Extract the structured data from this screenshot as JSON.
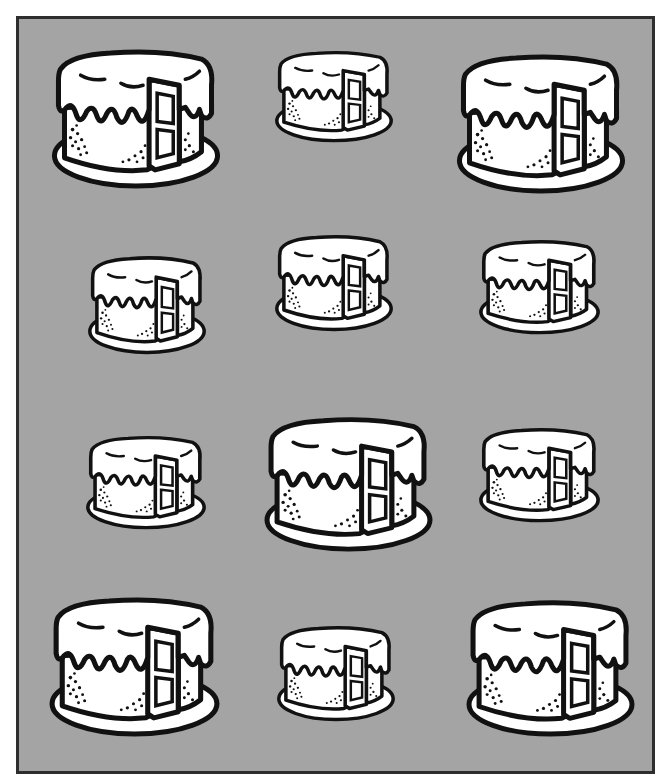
{
  "image": {
    "description": "Grid of twelve black-and-white line-art frosted layer cakes with a slice removed, on a gray background inside a dark border",
    "subject": "cake",
    "count": 12,
    "layout": {
      "rows": 4,
      "cols": 3
    }
  },
  "colors": {
    "background_gray": "#a4a4a4",
    "border": "#2e2e2e",
    "outline": "#111111",
    "fill": "#ffffff",
    "page": "#ffffff"
  },
  "cakes": [
    {
      "row": 1,
      "col": 1,
      "size": "large",
      "x": 50,
      "y": 45,
      "w": 172,
      "h": 146
    },
    {
      "row": 1,
      "col": 2,
      "size": "small",
      "x": 274,
      "y": 48,
      "w": 120,
      "h": 96
    },
    {
      "row": 1,
      "col": 3,
      "size": "large",
      "x": 455,
      "y": 50,
      "w": 172,
      "h": 146
    },
    {
      "row": 2,
      "col": 1,
      "size": "small",
      "x": 87,
      "y": 253,
      "w": 120,
      "h": 103
    },
    {
      "row": 2,
      "col": 2,
      "size": "small",
      "x": 274,
      "y": 232,
      "w": 120,
      "h": 101
    },
    {
      "row": 2,
      "col": 3,
      "size": "small",
      "x": 478,
      "y": 237,
      "w": 123,
      "h": 99
    },
    {
      "row": 3,
      "col": 1,
      "size": "small",
      "x": 85,
      "y": 433,
      "w": 122,
      "h": 98
    },
    {
      "row": 3,
      "col": 2,
      "size": "large",
      "x": 263,
      "y": 413,
      "w": 171,
      "h": 141
    },
    {
      "row": 3,
      "col": 3,
      "size": "small",
      "x": 478,
      "y": 425,
      "w": 123,
      "h": 99
    },
    {
      "row": 4,
      "col": 1,
      "size": "large",
      "x": 48,
      "y": 593,
      "w": 173,
      "h": 146
    },
    {
      "row": 4,
      "col": 2,
      "size": "small",
      "x": 276,
      "y": 623,
      "w": 120,
      "h": 100
    },
    {
      "row": 4,
      "col": 3,
      "size": "large",
      "x": 465,
      "y": 596,
      "w": 171,
      "h": 143
    }
  ]
}
